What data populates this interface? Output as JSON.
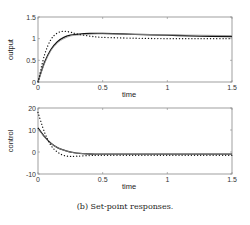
{
  "caption": "(b) Set-point responses.",
  "chart_data": [
    {
      "type": "line",
      "ylabel": "output",
      "xlabel": "time",
      "xlim": [
        0,
        1.5
      ],
      "ylim": [
        0,
        1.5
      ],
      "xticks": [
        "0",
        "0.5",
        "1",
        "1.5"
      ],
      "yticks": [
        "0",
        "0.5",
        "1",
        "1.5"
      ],
      "grid": false,
      "x": [
        0,
        0.05,
        0.1,
        0.15,
        0.2,
        0.25,
        0.3,
        0.4,
        0.5,
        0.75,
        1.0,
        1.25,
        1.5
      ],
      "series": [
        {
          "name": "solid-black",
          "style": "solid",
          "color": "#111111",
          "values": [
            0,
            0.45,
            0.75,
            0.93,
            1.03,
            1.08,
            1.1,
            1.12,
            1.12,
            1.1,
            1.08,
            1.06,
            1.05
          ]
        },
        {
          "name": "solid-gray",
          "style": "solid",
          "color": "#999999",
          "values": [
            0,
            0.42,
            0.72,
            0.9,
            1.0,
            1.06,
            1.08,
            1.1,
            1.11,
            1.1,
            1.09,
            1.08,
            1.07
          ]
        },
        {
          "name": "dotted",
          "style": "dotted",
          "color": "#111111",
          "values": [
            0,
            0.62,
            0.98,
            1.13,
            1.17,
            1.15,
            1.11,
            1.06,
            1.03,
            1.01,
            1.0,
            1.0,
            1.0
          ]
        }
      ]
    },
    {
      "type": "line",
      "ylabel": "control",
      "xlabel": "time",
      "xlim": [
        0,
        1.5
      ],
      "ylim": [
        -10,
        20
      ],
      "xticks": [
        "0",
        "0.5",
        "1",
        "1.5"
      ],
      "yticks": [
        "-10",
        "0",
        "10",
        "20"
      ],
      "grid": false,
      "x": [
        0,
        0.05,
        0.1,
        0.15,
        0.2,
        0.25,
        0.3,
        0.4,
        0.5,
        0.75,
        1.0,
        1.25,
        1.5
      ],
      "series": [
        {
          "name": "solid-black",
          "style": "solid",
          "color": "#111111",
          "values": [
            11,
            7,
            4,
            2,
            0.8,
            0,
            -0.5,
            -0.9,
            -1,
            -1,
            -1,
            -1,
            -1
          ]
        },
        {
          "name": "solid-gray",
          "style": "solid",
          "color": "#999999",
          "values": [
            10.5,
            6.8,
            3.9,
            2,
            0.8,
            0,
            -0.5,
            -0.9,
            -1,
            -1,
            -1,
            -1,
            -1
          ]
        },
        {
          "name": "dotted",
          "style": "dotted",
          "color": "#111111",
          "values": [
            18,
            9,
            3,
            0,
            -1.6,
            -2,
            -1.9,
            -1.6,
            -1.5,
            -1.5,
            -1.5,
            -1.5,
            -1.5
          ]
        }
      ]
    }
  ]
}
